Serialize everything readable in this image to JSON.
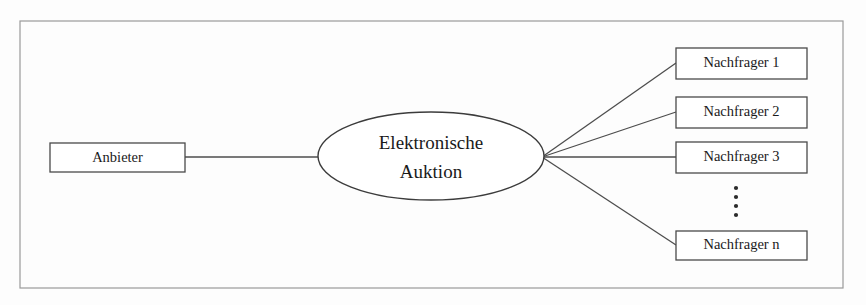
{
  "diagram": {
    "title": "Elektronische Auktion",
    "frame": {
      "x": 20,
      "y": 21,
      "width": 823,
      "height": 267
    },
    "supplier": {
      "label": "Anbieter",
      "x": 50,
      "y": 143,
      "width": 135,
      "height": 29
    },
    "hub": {
      "line1": "Elektronische",
      "line2": "Auktion",
      "cx": 431,
      "cy": 156,
      "rx": 113,
      "ry": 44
    },
    "hub_connector": {
      "from_x": 185,
      "from_y": 157,
      "to_x": 318,
      "to_y": 157
    },
    "fan_origin": {
      "x": 542,
      "y": 157
    },
    "demanders": [
      {
        "label": "Nachfrager 1",
        "x": 676,
        "y": 48,
        "width": 131,
        "height": 31,
        "anchor_y": 63
      },
      {
        "label": "Nachfrager 2",
        "x": 676,
        "y": 97,
        "width": 131,
        "height": 31,
        "anchor_y": 112
      },
      {
        "label": "Nachfrager 3",
        "x": 676,
        "y": 142,
        "width": 131,
        "height": 31,
        "anchor_y": 157
      },
      {
        "label": "Nachfrager n",
        "x": 676,
        "y": 231,
        "width": 131,
        "height": 29,
        "anchor_y": 245
      }
    ],
    "ellipsis": {
      "cx": 736,
      "dots_y": [
        188,
        197,
        206,
        215
      ],
      "radius": 2.1,
      "count": 4
    },
    "colors": {
      "background": "#fdfdfd",
      "frame_stroke": "#9a9a9a",
      "node_stroke": "#4a4a4a",
      "edge_stroke": "#4d4d4d",
      "text": "#1a1a1a",
      "node_fill": "#ffffff"
    }
  }
}
